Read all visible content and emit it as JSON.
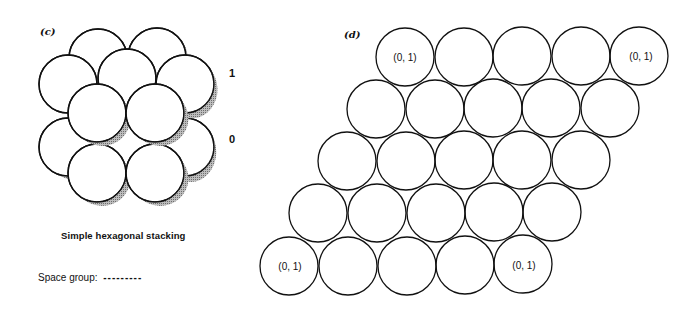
{
  "panel_c": {
    "label": "(c)",
    "layer_labels": [
      "1",
      "0"
    ],
    "caption": "Simple hexagonal stacking",
    "space_group_label": "Space group:",
    "space_group_value": "---------"
  },
  "panel_d": {
    "label": "(d)",
    "rows": [
      {
        "count": 5,
        "labels": [
          "(0, 1)",
          "",
          "",
          "",
          "(0, 1)"
        ]
      },
      {
        "count": 5,
        "labels": [
          "",
          "",
          "",
          "",
          ""
        ]
      },
      {
        "count": 5,
        "labels": [
          "",
          "",
          "",
          "",
          ""
        ]
      },
      {
        "count": 5,
        "labels": [
          "",
          "",
          "",
          "",
          ""
        ]
      },
      {
        "count": 5,
        "labels": [
          "(0, 1)",
          "",
          "",
          "",
          "(0, 1)"
        ]
      }
    ]
  },
  "colors": {
    "stroke": "#111111",
    "shade": "#9a9a9a",
    "background": "#ffffff"
  }
}
